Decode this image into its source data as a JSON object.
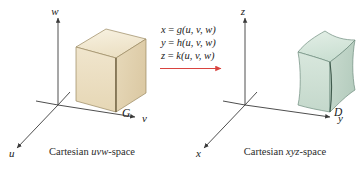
{
  "figure": {
    "background_color": "#ffffff"
  },
  "left_panel": {
    "caption_prefix": "Cartesian ",
    "caption_space": "uvw",
    "caption_suffix": "-space",
    "caption_full": "Cartesian uvw-space",
    "axes": [
      {
        "name": "w-axis",
        "label": "w",
        "direction": "up"
      },
      {
        "name": "v-axis",
        "label": "v",
        "direction": "right"
      },
      {
        "name": "u-axis",
        "label": "u",
        "direction": "down-left"
      }
    ],
    "solid": {
      "label": "G",
      "shape_name": "rectangular-box",
      "fill_color": "#efe3c9",
      "top_face_color": "#f4ecd8",
      "front_face_color": "#eadcbd",
      "side_face_color": "#e4d4b2",
      "edge_color": "#8d7a53"
    }
  },
  "right_panel": {
    "caption_prefix": "Cartesian ",
    "caption_space": "xyz",
    "caption_suffix": "-space",
    "caption_full": "Cartesian xyz-space",
    "axes": [
      {
        "name": "z-axis",
        "label": "z",
        "direction": "up"
      },
      {
        "name": "y-axis",
        "label": "y",
        "direction": "right"
      },
      {
        "name": "x-axis",
        "label": "x",
        "direction": "down-left"
      }
    ],
    "solid": {
      "label": "D",
      "shape_name": "curved-box",
      "fill_color": "#cfded2",
      "top_face_color": "#dce9e0",
      "front_face_color": "#c9dbd0",
      "side_face_color": "#bed3c7",
      "edge_color": "#5d7a6b"
    }
  },
  "transformation": {
    "arrow_color": "#d9433f",
    "arrow_name": "mapping-arrow",
    "equations": [
      {
        "lhs": "x",
        "eq": " = ",
        "fn": "g",
        "args": "(u, v, w)",
        "text": "x = g(u, v, w)"
      },
      {
        "lhs": "y",
        "eq": " = ",
        "fn": "h",
        "args": "(u, v, w)",
        "text": "y = h(u, v, w)"
      },
      {
        "lhs": "z",
        "eq": " = ",
        "fn": "k",
        "args": "(u, v, w)",
        "text": "z = k(u, v, w)"
      }
    ]
  }
}
